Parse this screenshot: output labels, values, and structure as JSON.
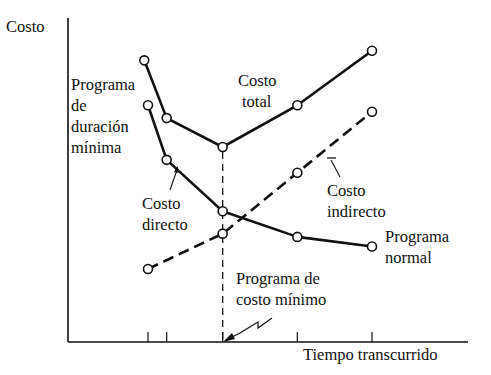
{
  "chart_data": {
    "type": "line",
    "title": "",
    "xlabel": "Tiempo transcurrido",
    "ylabel": "Costo",
    "grid": false,
    "x_ticks": [
      1.0,
      1.25,
      2.0,
      3.0,
      4.0
    ],
    "xlim": [
      -1.0,
      4.3
    ],
    "ylim": [
      0,
      10
    ],
    "series": [
      {
        "name": "Costo total",
        "style": "solid",
        "points": [
          [
            0.95,
            8.7
          ],
          [
            1.25,
            6.9
          ],
          [
            2.0,
            6.0
          ],
          [
            3.0,
            7.3
          ],
          [
            4.0,
            9.0
          ]
        ]
      },
      {
        "name": "Costo directo",
        "style": "solid",
        "points": [
          [
            1.0,
            7.3
          ],
          [
            1.25,
            5.6
          ],
          [
            2.0,
            4.0
          ],
          [
            3.0,
            3.2
          ],
          [
            4.0,
            2.9
          ]
        ]
      },
      {
        "name": "Costo indirecto",
        "style": "dashed",
        "points": [
          [
            1.0,
            2.2
          ],
          [
            2.0,
            3.3
          ],
          [
            3.0,
            5.2
          ],
          [
            4.0,
            7.1
          ]
        ]
      }
    ],
    "reference_line": {
      "x": 2.0,
      "style": "dashed",
      "label": "Programa de costo mínimo"
    },
    "annotations": {
      "programa_duracion_minima": [
        "Programa",
        "de",
        "duración",
        "mínima"
      ],
      "costo_total": [
        "Costo",
        "total"
      ],
      "costo_directo": [
        "Costo",
        "directo"
      ],
      "costo_indirecto": [
        "Costo",
        "indirecto"
      ],
      "programa_normal": [
        "Programa",
        "normal"
      ],
      "programa_costo_minimo": [
        "Programa de",
        "costo mínimo"
      ]
    }
  }
}
